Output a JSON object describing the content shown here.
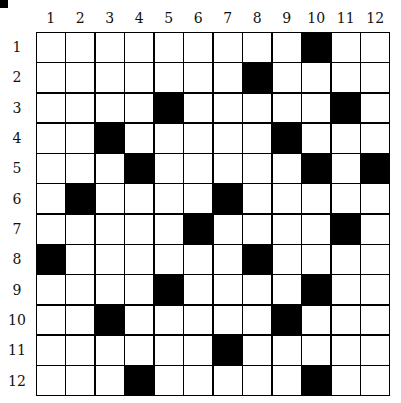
{
  "puzzle": {
    "rows": 12,
    "cols": 12,
    "column_labels": [
      "1",
      "2",
      "3",
      "4",
      "5",
      "6",
      "7",
      "8",
      "9",
      "10",
      "11",
      "12"
    ],
    "row_labels": [
      "1",
      "2",
      "3",
      "4",
      "5",
      "6",
      "7",
      "8",
      "9",
      "10",
      "11",
      "12"
    ],
    "black_cells": [
      [
        1,
        10
      ],
      [
        2,
        8
      ],
      [
        3,
        5
      ],
      [
        3,
        11
      ],
      [
        4,
        3
      ],
      [
        4,
        9
      ],
      [
        5,
        4
      ],
      [
        5,
        10
      ],
      [
        5,
        12
      ],
      [
        6,
        2
      ],
      [
        6,
        7
      ],
      [
        7,
        6
      ],
      [
        7,
        11
      ],
      [
        8,
        1
      ],
      [
        8,
        8
      ],
      [
        9,
        5
      ],
      [
        9,
        10
      ],
      [
        10,
        3
      ],
      [
        10,
        9
      ],
      [
        11,
        7
      ],
      [
        12,
        4
      ],
      [
        12,
        10
      ]
    ],
    "colors": {
      "filled": "#000000",
      "empty": "#ffffff",
      "grid_line": "#000000"
    }
  }
}
